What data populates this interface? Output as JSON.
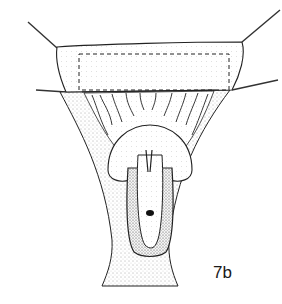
{
  "figure": {
    "label": "7b",
    "colors": {
      "ink": "#1a1a1a",
      "paper": "#ffffff",
      "stipple": "#6a6a6a"
    }
  }
}
